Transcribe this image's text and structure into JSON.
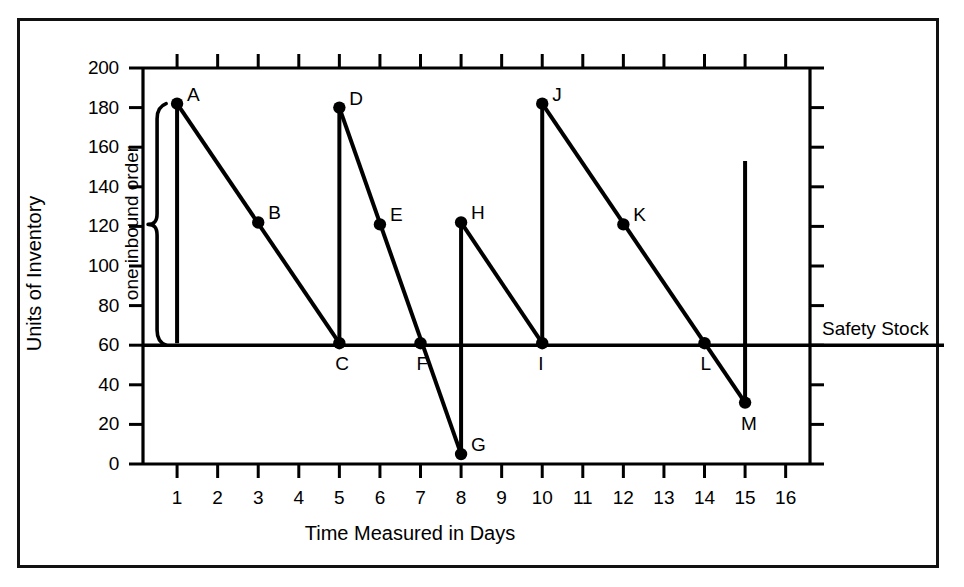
{
  "chart_data": {
    "type": "line",
    "title": "",
    "xlabel": "Time Measured in Days",
    "ylabel": "Units of Inventory",
    "xlim": [
      0,
      16.6
    ],
    "ylim": [
      0,
      200
    ],
    "grid": false,
    "legend": "none",
    "x_ticks": [
      "1",
      "2",
      "3",
      "4",
      "5",
      "6",
      "7",
      "8",
      "9",
      "10",
      "11",
      "12",
      "13",
      "14",
      "15",
      "16"
    ],
    "x_tick_values": [
      1,
      2,
      3,
      4,
      5,
      6,
      7,
      8,
      9,
      10,
      11,
      12,
      13,
      14,
      15,
      16
    ],
    "y_ticks": [
      "0",
      "20",
      "40",
      "60",
      "80",
      "100",
      "120",
      "140",
      "160",
      "180",
      "200"
    ],
    "y_tick_values": [
      0,
      20,
      40,
      60,
      80,
      100,
      120,
      140,
      160,
      180,
      200
    ],
    "safety_stock": {
      "label": "Safety Stock",
      "value": 60
    },
    "annotation_brace": {
      "label": "one inbound order",
      "x": 1,
      "from": 60,
      "to": 182
    },
    "points": [
      {
        "label": "A",
        "x": 1,
        "y": 182,
        "label_pos": "right"
      },
      {
        "label": "B",
        "x": 3,
        "y": 122,
        "label_pos": "right"
      },
      {
        "label": "C",
        "x": 5,
        "y": 61,
        "label_pos": "below"
      },
      {
        "label": "D",
        "x": 5,
        "y": 180,
        "label_pos": "right"
      },
      {
        "label": "E",
        "x": 6,
        "y": 121,
        "label_pos": "right"
      },
      {
        "label": "F",
        "x": 7,
        "y": 61,
        "label_pos": "below"
      },
      {
        "label": "G",
        "x": 8,
        "y": 5,
        "label_pos": "right"
      },
      {
        "label": "H",
        "x": 8,
        "y": 122,
        "label_pos": "right"
      },
      {
        "label": "I",
        "x": 10,
        "y": 61,
        "label_pos": "below"
      },
      {
        "label": "J",
        "x": 10,
        "y": 182,
        "label_pos": "right"
      },
      {
        "label": "K",
        "x": 12,
        "y": 121,
        "label_pos": "right"
      },
      {
        "label": "L",
        "x": 14,
        "y": 61,
        "label_pos": "below"
      },
      {
        "label": "M",
        "x": 15,
        "y": 31,
        "label_pos": "below"
      }
    ],
    "segments": [
      {
        "name": "replenish-1",
        "from": [
          1,
          61
        ],
        "to": [
          1,
          182
        ]
      },
      {
        "name": "depletion-1",
        "from": [
          1,
          182
        ],
        "to": [
          5,
          61
        ]
      },
      {
        "name": "replenish-2",
        "from": [
          5,
          61
        ],
        "to": [
          5,
          180
        ]
      },
      {
        "name": "depletion-2",
        "from": [
          5,
          180
        ],
        "to": [
          8,
          5
        ]
      },
      {
        "name": "replenish-3",
        "from": [
          8,
          5
        ],
        "to": [
          8,
          122
        ]
      },
      {
        "name": "depletion-3",
        "from": [
          8,
          122
        ],
        "to": [
          10,
          61
        ]
      },
      {
        "name": "replenish-4",
        "from": [
          10,
          61
        ],
        "to": [
          10,
          182
        ]
      },
      {
        "name": "depletion-4",
        "from": [
          10,
          182
        ],
        "to": [
          15,
          31
        ]
      },
      {
        "name": "replenish-5",
        "from": [
          15,
          31
        ],
        "to": [
          15,
          153
        ]
      }
    ],
    "series": [
      {
        "name": "Inventory level",
        "x": [
          1,
          1,
          5,
          5,
          8,
          8,
          10,
          10,
          15,
          15
        ],
        "values": [
          61,
          182,
          61,
          180,
          5,
          122,
          61,
          182,
          31,
          153
        ]
      }
    ],
    "colors": {
      "line": "#000000",
      "axis": "#000000",
      "background": "#ffffff",
      "frame": "#111111"
    }
  }
}
